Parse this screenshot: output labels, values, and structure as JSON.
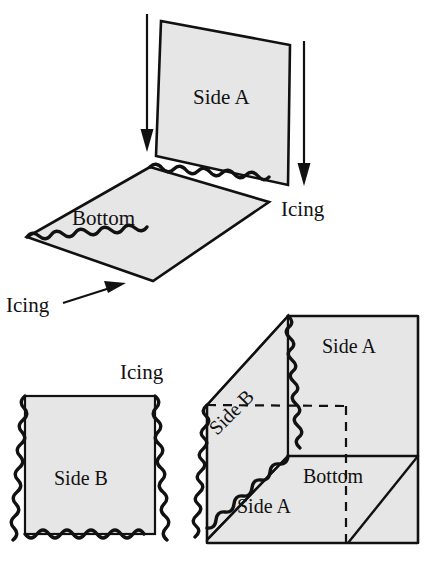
{
  "figure": {
    "background_color": "#ffffff",
    "ink_color": "#111111",
    "panel_fill_color": "#e6e6e6",
    "labels": {
      "side_a_top": "Side A",
      "bottom_top": "Bottom",
      "icing_right": "Icing",
      "icing_left": "Icing",
      "icing_mid": "Icing",
      "side_b_square": "Side B",
      "box_side_a": "Side A",
      "box_bottom": "Bottom",
      "box_side_a2": "Side A",
      "box_side_b": "Side B"
    },
    "panels": [
      {
        "name": "side-a-upright",
        "label": "Side A",
        "group": "exploded-top"
      },
      {
        "name": "bottom-slab",
        "label": "Bottom",
        "group": "exploded-top"
      },
      {
        "name": "side-b-flat",
        "label": "Side B",
        "group": "flat-square"
      },
      {
        "name": "box-side-a-right",
        "label": "Side A",
        "group": "assembled-box"
      },
      {
        "name": "box-side-b-left",
        "label": "Side B",
        "group": "assembled-box"
      },
      {
        "name": "box-bottom-face",
        "label": "Bottom",
        "group": "assembled-box"
      },
      {
        "name": "box-side-a-front",
        "label": "Side A",
        "group": "assembled-box"
      }
    ],
    "arrows": [
      {
        "name": "assembly-arrow-left",
        "direction": "down"
      },
      {
        "name": "assembly-arrow-right",
        "direction": "down"
      },
      {
        "name": "icing-pointer-arrow",
        "direction": "up-right"
      }
    ],
    "icing_edges": [
      "bottom-slab-back-edge",
      "bottom-slab-front-edge",
      "side-b-left-edge",
      "side-b-right-edge",
      "side-b-bottom-edge",
      "box-vertical-seam",
      "box-left-seam",
      "box-diagonal-seam"
    ]
  }
}
